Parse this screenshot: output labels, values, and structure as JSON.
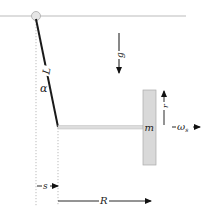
{
  "diagram": {
    "labels": {
      "rod_length": "L",
      "angle": "α",
      "gravity": "g",
      "mass": "m",
      "offset": "r",
      "angular_velocity": "ω",
      "angular_velocity_sub": "s",
      "pivot_offset": "s",
      "radius": "R"
    },
    "colors": {
      "rod": "#1a1a1a",
      "ceiling": "#bbbbbb",
      "bar_fill": "#dddddd",
      "block_fill": "#d9d9d9",
      "block_stroke": "#aaaaaa",
      "dotted": "#aaaaaa",
      "arrow": "#111111"
    }
  }
}
